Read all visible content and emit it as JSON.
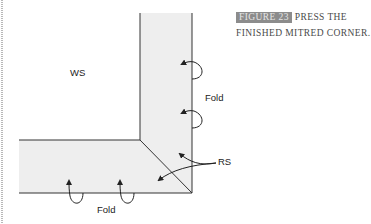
{
  "caption": {
    "figure_tag": "FIGURE 23",
    "line1": "PRESS THE",
    "line2": "FINISHED MITRED CORNER."
  },
  "labels": {
    "ws": "WS",
    "fold_right": "Fold",
    "rs": "RS",
    "fold_bottom": "Fold"
  },
  "colors": {
    "strip_fill": "#eeeeee",
    "line": "#333333",
    "caption_tag_bg": "#8c8c8c",
    "caption_text": "#4a4a4a"
  }
}
